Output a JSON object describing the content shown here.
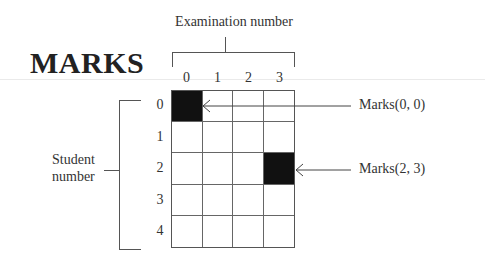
{
  "title": "MARKS",
  "column_axis": {
    "label": "Examination number",
    "ticks": [
      "0",
      "1",
      "2",
      "3"
    ]
  },
  "row_axis": {
    "label_line1": "Student",
    "label_line2": "number",
    "ticks": [
      "0",
      "1",
      "2",
      "3",
      "4"
    ]
  },
  "grid": {
    "rows": 5,
    "cols": 4,
    "highlighted_cells": [
      [
        0,
        0
      ],
      [
        2,
        3
      ]
    ],
    "highlight_color": "#111111"
  },
  "callouts": [
    {
      "label": "Marks(0, 0)",
      "row": 0,
      "col": 0
    },
    {
      "label": "Marks(2, 3)",
      "row": 2,
      "col": 3
    }
  ]
}
